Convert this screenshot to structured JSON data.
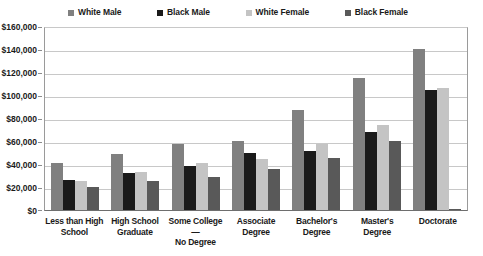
{
  "chart_data": {
    "type": "bar",
    "title": "",
    "xlabel": "",
    "ylabel": "",
    "ylim": [
      0,
      160000
    ],
    "ytick_step": 20000,
    "grid": true,
    "legend_position": "top",
    "categories": [
      "Less than High School",
      "High School Graduate",
      "Some College—No Degree",
      "Associate Degree",
      "Bachelor's Degree",
      "Master's Degree",
      "Doctorate"
    ],
    "category_lines": [
      [
        "Less than High",
        "School"
      ],
      [
        "High School",
        "Graduate"
      ],
      [
        "Some College—",
        "No Degree"
      ],
      [
        "Associate",
        "Degree"
      ],
      [
        "Bachelor's",
        "Degree"
      ],
      [
        "Master's",
        "Degree"
      ],
      [
        "Doctorate"
      ]
    ],
    "ytick_labels": [
      "$160,000",
      "$140,000",
      "$120,000",
      "$100,000",
      "$80,000",
      "$60,000",
      "$40,000",
      "$20,000",
      "$0"
    ],
    "ytick_values": [
      160000,
      140000,
      120000,
      100000,
      80000,
      60000,
      40000,
      20000,
      0
    ],
    "series": [
      {
        "name": "White Male",
        "color": "#808080",
        "values": [
          41000,
          49000,
          57000,
          60000,
          87000,
          115000,
          140000
        ]
      },
      {
        "name": "Black Male",
        "color": "#1a1a1a",
        "values": [
          26000,
          32000,
          38000,
          50000,
          51000,
          68000,
          104000
        ]
      },
      {
        "name": "White Female",
        "color": "#c4c4c4",
        "values": [
          25000,
          33000,
          41000,
          44000,
          57000,
          74000,
          106000
        ]
      },
      {
        "name": "Black Female",
        "color": "#595959",
        "values": [
          20000,
          25000,
          29000,
          36000,
          45000,
          60000,
          1000
        ]
      }
    ]
  }
}
